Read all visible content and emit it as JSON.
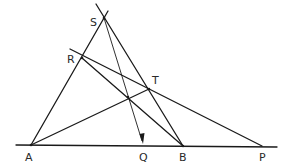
{
  "diagram": {
    "type": "geometry-construction",
    "points": {
      "S": {
        "label": "S",
        "x": 104,
        "y": 18,
        "lx": 90,
        "ly": 26
      },
      "R": {
        "label": "R",
        "x": 82,
        "y": 58,
        "lx": 67,
        "ly": 63
      },
      "T": {
        "label": "T",
        "x": 149,
        "y": 89,
        "lx": 152,
        "ly": 84
      },
      "A": {
        "label": "A",
        "x": 31,
        "y": 145,
        "lx": 25,
        "ly": 161
      },
      "Q": {
        "label": "Q",
        "x": 143,
        "y": 146,
        "lx": 140,
        "ly": 161
      },
      "B": {
        "label": "B",
        "x": 183,
        "y": 146,
        "lx": 179,
        "ly": 161
      },
      "P": {
        "label": "P",
        "x": 262,
        "y": 146,
        "lx": 259,
        "ly": 161
      },
      "X": {
        "label": "",
        "x": 128,
        "y": 97
      }
    },
    "labels": {
      "S": "S",
      "R": "R",
      "T": "T",
      "A": "A",
      "Q": "Q",
      "B": "B",
      "P": "P"
    },
    "segments": [
      {
        "name": "baseline",
        "from": "A",
        "to": "P"
      },
      {
        "name": "line-AS",
        "from": "A",
        "to": "S"
      },
      {
        "name": "line-SB",
        "from": "S",
        "to": "B"
      },
      {
        "name": "line-RP",
        "from": "R",
        "to": "P"
      },
      {
        "name": "line-RB",
        "from": "R",
        "to": "B"
      },
      {
        "name": "line-AT",
        "from": "A",
        "to": "T"
      },
      {
        "name": "line-SQ-arrow",
        "from": "S",
        "to": "Q"
      }
    ]
  }
}
